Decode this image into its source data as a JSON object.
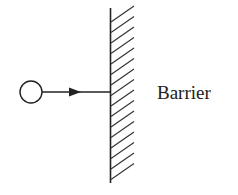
{
  "diagram": {
    "labels": {
      "barrier": "Barrier"
    },
    "elements": {
      "ball": "circle",
      "velocity_arrow": "arrow pointing right",
      "barrier": "hatched wall"
    },
    "colors": {
      "stroke": "#222222",
      "background": "#ffffff"
    }
  }
}
